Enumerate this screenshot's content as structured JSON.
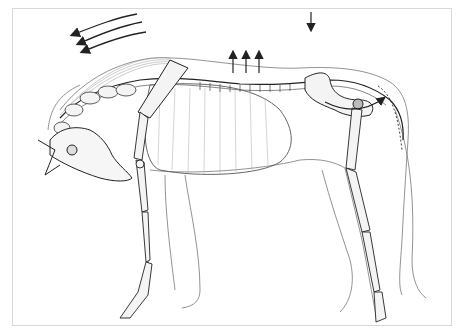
{
  "figure": {
    "annotations": {
      "neck_arrows": {
        "count": 3,
        "direction": "forward-down",
        "description": "Three curved arrows above the neck pointing left"
      },
      "back_arrows_up": {
        "count": 3,
        "direction": "up",
        "description": "Three short upward arrows over thoracic spine"
      },
      "back_arrow_down": {
        "count": 1,
        "direction": "down",
        "description": "Single downward arrow above lumbar region"
      },
      "pelvis_rotation_arrow": {
        "count": 1,
        "direction": "curved clockwise",
        "description": "Curved arrow around pelvis / hip joint"
      }
    },
    "colors": {
      "line": "#2a2a2a",
      "light_line": "#8a8a8a",
      "background": "#ffffff",
      "frame": "#d8d8d8"
    }
  }
}
